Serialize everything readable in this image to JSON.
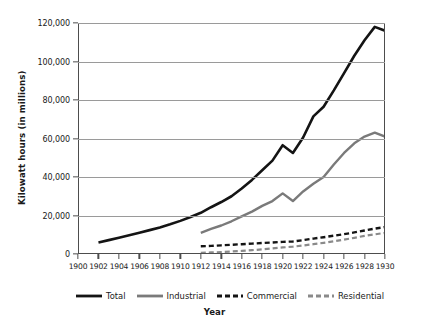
{
  "chart_data": {
    "type": "line",
    "title": "",
    "xlabel": "Year",
    "ylabel": "Kilowatt hours (in millions)",
    "xlim": [
      1900,
      1930
    ],
    "ylim": [
      0,
      120000
    ],
    "grid": true,
    "legend_position": "bottom",
    "x_ticks": [
      1900,
      1902,
      1904,
      1906,
      1908,
      1910,
      1912,
      1914,
      1916,
      1918,
      1920,
      1922,
      1924,
      1926,
      1928,
      1930
    ],
    "x_tick_labels": [
      "1900",
      "1902",
      "1904",
      "1906",
      "1908",
      "1910",
      "1912",
      "1914",
      "1916",
      "1918",
      "1920",
      "1922",
      "1924",
      "1926",
      "1928",
      "1930"
    ],
    "y_ticks": [
      0,
      20000,
      40000,
      60000,
      80000,
      100000,
      120000
    ],
    "y_tick_labels": [
      "0",
      "20,000",
      "40,000",
      "60,000",
      "80,000",
      "100,000",
      "120,000"
    ],
    "series": [
      {
        "name": "Total",
        "color": "#141414",
        "style": "solid",
        "x": [
          1902,
          1903,
          1904,
          1905,
          1906,
          1907,
          1908,
          1909,
          1910,
          1911,
          1912,
          1913,
          1914,
          1915,
          1916,
          1917,
          1918,
          1919,
          1920,
          1921,
          1922,
          1923,
          1924,
          1925,
          1926,
          1927,
          1928,
          1929,
          1930
        ],
        "values": [
          6000,
          7200,
          8400,
          9700,
          11000,
          12400,
          13800,
          15400,
          17200,
          19200,
          21400,
          24300,
          27000,
          30000,
          34000,
          38500,
          43500,
          48500,
          56500,
          52500,
          60500,
          71500,
          76500,
          85000,
          94000,
          103000,
          111000,
          118000,
          116000
        ]
      },
      {
        "name": "Industrial",
        "color": "#7a7a7a",
        "style": "solid",
        "x": [
          1912,
          1913,
          1914,
          1915,
          1916,
          1917,
          1918,
          1919,
          1920,
          1921,
          1922,
          1923,
          1924,
          1925,
          1926,
          1927,
          1928,
          1929,
          1930
        ],
        "values": [
          11000,
          13000,
          14800,
          17000,
          19500,
          22000,
          25000,
          27500,
          31500,
          27500,
          32500,
          36500,
          40000,
          46500,
          52500,
          57500,
          61000,
          63000,
          61000
        ]
      },
      {
        "name": "Commercial",
        "color": "#141414",
        "style": "dashed",
        "x": [
          1912,
          1913,
          1914,
          1915,
          1916,
          1917,
          1918,
          1919,
          1920,
          1921,
          1922,
          1923,
          1924,
          1925,
          1926,
          1927,
          1928,
          1929,
          1930
        ],
        "values": [
          4000,
          4200,
          4500,
          4800,
          5100,
          5400,
          5700,
          6000,
          6300,
          6500,
          7200,
          8000,
          8700,
          9500,
          10300,
          11200,
          12200,
          13200,
          14000
        ]
      },
      {
        "name": "Residential",
        "color": "#8a8a8a",
        "style": "dashed",
        "x": [
          1912,
          1913,
          1914,
          1915,
          1916,
          1917,
          1918,
          1919,
          1920,
          1921,
          1922,
          1923,
          1924,
          1925,
          1926,
          1927,
          1928,
          1929,
          1930
        ],
        "values": [
          600,
          800,
          1000,
          1300,
          1600,
          2000,
          2400,
          2900,
          3400,
          3800,
          4400,
          5100,
          5800,
          6600,
          7500,
          8400,
          9400,
          10200,
          11000
        ]
      }
    ]
  },
  "legend": {
    "items": [
      {
        "label": "Total"
      },
      {
        "label": "Industrial"
      },
      {
        "label": "Commercial"
      },
      {
        "label": "Residential"
      }
    ]
  },
  "axis_titles": {
    "x": "Year",
    "y": "Kilowatt hours (in millions)"
  }
}
